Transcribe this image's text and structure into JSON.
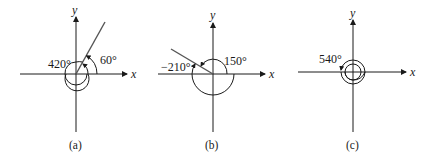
{
  "figures": [
    {
      "id": "a",
      "caption": "(a)",
      "x_label": "x",
      "y_label": "y",
      "angles": [
        {
          "label": "420°",
          "value": 420,
          "kind": "coterminal"
        },
        {
          "label": "60°",
          "value": 60,
          "kind": "standard"
        }
      ],
      "terminal_ray_degrees": 60
    },
    {
      "id": "b",
      "caption": "(b)",
      "x_label": "x",
      "y_label": "y",
      "angles": [
        {
          "label": "−210°",
          "value": -210,
          "kind": "coterminal"
        },
        {
          "label": "150°",
          "value": 150,
          "kind": "standard"
        }
      ],
      "terminal_ray_degrees": 150
    },
    {
      "id": "c",
      "caption": "(c)",
      "x_label": "x",
      "y_label": "y",
      "angles": [
        {
          "label": "540°",
          "value": 540,
          "kind": "rotation"
        }
      ],
      "terminal_ray_degrees": 180
    }
  ],
  "colors": {
    "line": "#1a1a1a",
    "ray": "#555555",
    "background": "#ffffff"
  }
}
